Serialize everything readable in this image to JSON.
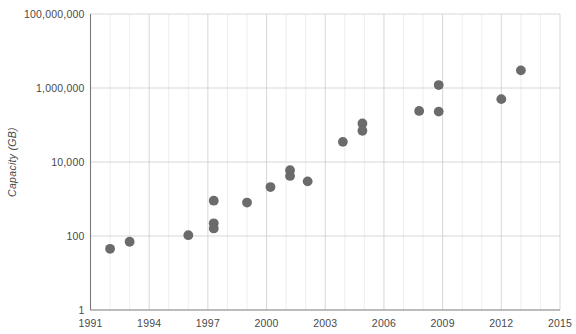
{
  "chart_data": {
    "type": "scatter",
    "title": "",
    "xlabel": "",
    "ylabel": "Capacity (GB)",
    "yscale": "log",
    "ylim": [
      1,
      100000000
    ],
    "xlim": [
      1991,
      2015
    ],
    "grid": true,
    "legend": false,
    "marker_color": "#6b6b6b",
    "y_ticks": [
      {
        "value": 1,
        "label": "1"
      },
      {
        "value": 100,
        "label": "100"
      },
      {
        "value": 10000,
        "label": "10,000"
      },
      {
        "value": 1000000,
        "label": "1,000,000"
      },
      {
        "value": 100000000,
        "label": "100,000,000"
      }
    ],
    "x_ticks": [
      {
        "value": 1991,
        "label": "1991"
      },
      {
        "value": 1994,
        "label": "1994"
      },
      {
        "value": 1997,
        "label": "1997"
      },
      {
        "value": 2000,
        "label": "2000"
      },
      {
        "value": 2003,
        "label": "2003"
      },
      {
        "value": 2006,
        "label": "2006"
      },
      {
        "value": 2009,
        "label": "2009"
      },
      {
        "value": 2012,
        "label": "2012"
      },
      {
        "value": 2015,
        "label": "2015"
      }
    ],
    "x_minor_ticks": [
      1992,
      1993,
      1995,
      1996,
      1998,
      1999,
      2001,
      2002,
      2004,
      2005,
      2007,
      2008,
      2010,
      2011,
      2013,
      2014
    ],
    "points": [
      {
        "x": 1992.0,
        "y": 45
      },
      {
        "x": 1993.0,
        "y": 70
      },
      {
        "x": 1996.0,
        "y": 105
      },
      {
        "x": 1997.3,
        "y": 900
      },
      {
        "x": 1997.3,
        "y": 220
      },
      {
        "x": 1997.3,
        "y": 160
      },
      {
        "x": 1999.0,
        "y": 800
      },
      {
        "x": 2000.2,
        "y": 2100
      },
      {
        "x": 2001.2,
        "y": 6000
      },
      {
        "x": 2001.2,
        "y": 4200
      },
      {
        "x": 2002.1,
        "y": 3000
      },
      {
        "x": 2003.9,
        "y": 35000
      },
      {
        "x": 2004.9,
        "y": 110000
      },
      {
        "x": 2004.9,
        "y": 70000
      },
      {
        "x": 2007.8,
        "y": 240000
      },
      {
        "x": 2008.8,
        "y": 1200000
      },
      {
        "x": 2008.8,
        "y": 230000
      },
      {
        "x": 2012.0,
        "y": 500000
      },
      {
        "x": 2013.0,
        "y": 3000000
      }
    ]
  }
}
